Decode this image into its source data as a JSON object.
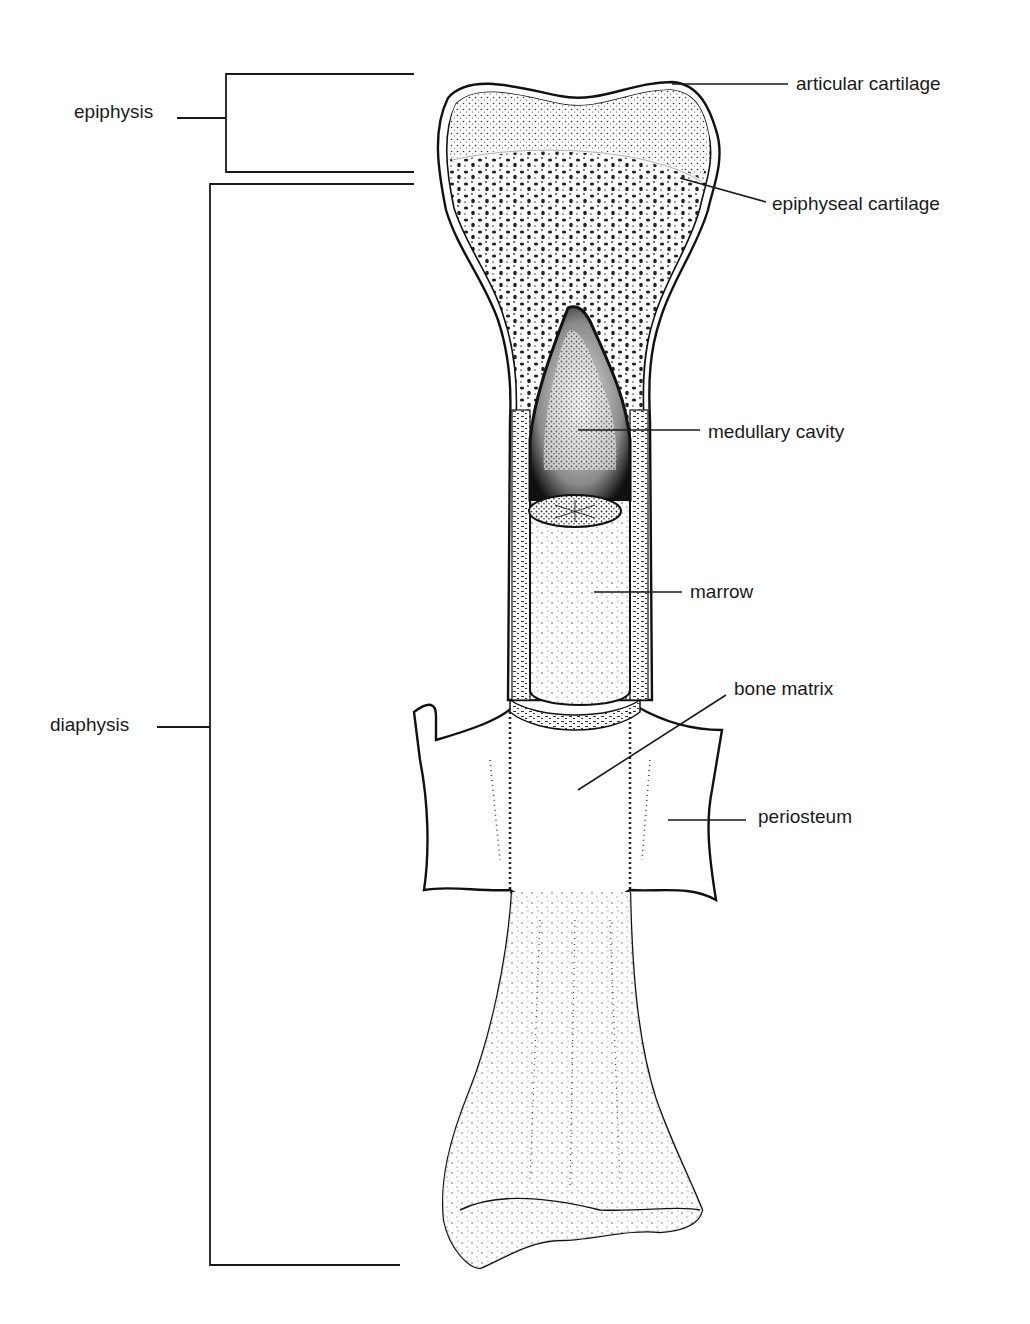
{
  "figure": {
    "colors": {
      "ink": "#1a1a1a",
      "background": "#ffffff"
    }
  },
  "brackets": [
    {
      "id": "epiphysis",
      "label": "epiphysis",
      "y_top": 73,
      "y_bottom": 172
    },
    {
      "id": "diaphysis",
      "label": "diaphysis",
      "y_top": 184,
      "y_bottom": 1264
    }
  ],
  "labels": [
    {
      "id": "articular-cartilage",
      "text": "articular cartilage"
    },
    {
      "id": "epiphyseal-cartilage",
      "text": "epiphyseal cartilage"
    },
    {
      "id": "medullary-cavity",
      "text": "medullary cavity"
    },
    {
      "id": "marrow",
      "text": "marrow"
    },
    {
      "id": "bone-matrix",
      "text": "bone matrix"
    },
    {
      "id": "periosteum",
      "text": "periosteum"
    }
  ]
}
